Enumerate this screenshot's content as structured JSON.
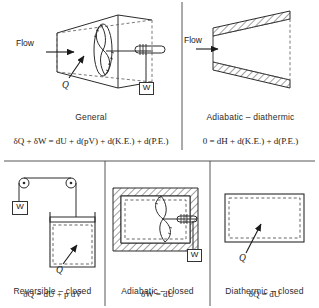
{
  "figure": {
    "type": "thermodynamics-system-diagram",
    "background": "#ffffff",
    "line_color": "#333333",
    "panels": [
      {
        "id": "general",
        "caption": "General",
        "equation_parts": {
          "lhs": "δQ + δW",
          "eq": "=",
          "rhs": "dU + d(pV) + d(K.E.) + d(P.E.)"
        },
        "equation": "δQ + δW = dU + d(pV) + d(K.E.) + d(P.E.)",
        "labels": {
          "flow": "Flow",
          "heat": "Q",
          "work": "W"
        },
        "elements": [
          "diverging-duct",
          "turbine-rotor",
          "shaft",
          "coil",
          "weight-box",
          "heat-arrow",
          "flow-arrow",
          "control-surface-dashed"
        ]
      },
      {
        "id": "adiabatic-diathermic",
        "caption": "Adiabatic – diathermic",
        "equation_parts": {
          "lhs": "0",
          "eq": "=",
          "rhs": "dH + d(K.E.) + d(P.E.)"
        },
        "equation": "0 = dH + d(K.E.) + d(P.E.)",
        "labels": {
          "flow": "Flow"
        },
        "elements": [
          "hatched-insulated-nozzle",
          "flow-arrow",
          "control-surface-dashed"
        ]
      },
      {
        "id": "reversible-closed",
        "caption": "Reversible – closed",
        "equation_parts": {
          "lhs": "δQ",
          "eq": "=",
          "rhs": "dU + p dV"
        },
        "equation": "δQ = dU + p dV",
        "labels": {
          "heat": "Q",
          "work": "W"
        },
        "elements": [
          "pulley-left",
          "pulley-right",
          "cord",
          "weight-box",
          "piston",
          "cylinder",
          "heat-arrow",
          "system-boundary-dashed"
        ]
      },
      {
        "id": "adiabatic-closed",
        "caption": "Adiabatic – closed",
        "equation_parts": {
          "lhs": "δW",
          "eq": "=",
          "rhs": "dU"
        },
        "equation": "δW = dU",
        "labels": {
          "work": "W"
        },
        "elements": [
          "hatched-insulated-box",
          "paddle-wheel",
          "shaft",
          "coil",
          "weight-box",
          "system-boundary-dashed"
        ]
      },
      {
        "id": "diathermic-closed",
        "caption": "Diathermic – closed",
        "equation_parts": {
          "lhs": "δQ",
          "eq": "=",
          "rhs": "dU"
        },
        "equation": "δQ = dU",
        "labels": {
          "heat": "Q"
        },
        "elements": [
          "rigid-box",
          "heat-arrow",
          "system-boundary-dashed"
        ]
      }
    ]
  }
}
